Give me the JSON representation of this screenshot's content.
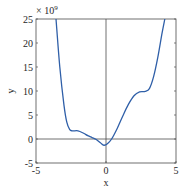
{
  "chart_data": {
    "type": "line",
    "title": "",
    "xlabel": "x",
    "ylabel": "y",
    "exponent_label": "× 10^9",
    "exponent_base": "× 10",
    "exponent_power": "9",
    "xlim": [
      -5,
      5
    ],
    "ylim": [
      -5,
      25
    ],
    "y_scale_multiplier": 1000000000,
    "xticks": [
      -5,
      0,
      5
    ],
    "xtick_labels": [
      "-5",
      "0",
      "5"
    ],
    "yticks": [
      -5,
      0,
      5,
      10,
      15,
      20,
      25
    ],
    "ytick_labels": [
      "-5",
      "0",
      "5",
      "10",
      "15",
      "20",
      "25"
    ],
    "grid": false,
    "box": true,
    "reference_lines": [
      {
        "orientation": "horizontal",
        "value": 0
      },
      {
        "orientation": "vertical",
        "value": 0
      }
    ],
    "line_color": "#2f5fa8",
    "series": [
      {
        "name": "y(x)",
        "x": [
          -3.57,
          -3.3,
          -3.0,
          -2.8,
          -2.6,
          -2.4,
          -2.0,
          -1.6,
          -1.3,
          -1.0,
          -0.7,
          -0.4,
          -0.15,
          0.1,
          0.4,
          0.8,
          1.2,
          1.6,
          2.0,
          2.4,
          2.8,
          3.1,
          3.4,
          3.7,
          4.0,
          4.2
        ],
        "y": [
          25,
          15,
          7,
          3.5,
          2.0,
          1.7,
          1.7,
          1.2,
          0.7,
          0.3,
          -0.1,
          -0.8,
          -1.3,
          -1.0,
          0.0,
          2.2,
          4.8,
          7.2,
          9.0,
          9.8,
          9.9,
          10.5,
          13.0,
          17.0,
          22.0,
          25
        ]
      }
    ]
  }
}
